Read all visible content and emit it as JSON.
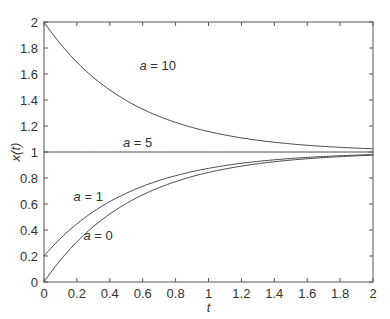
{
  "chart_data": {
    "type": "line",
    "title": "",
    "xlabel": "t",
    "ylabel": "x(t)",
    "xlim": [
      0,
      2
    ],
    "ylim": [
      0,
      2
    ],
    "grid": false,
    "legend": "none (inline annotations)",
    "x_ticks": [
      "0",
      "0.2",
      "0.4",
      "0.6",
      "0.8",
      "1",
      "1.2",
      "1.4",
      "1.6",
      "1.8",
      "2"
    ],
    "y_ticks": [
      "0",
      "0.2",
      "0.4",
      "0.6",
      "0.8",
      "1",
      "1.2",
      "1.4",
      "1.6",
      "1.8",
      "2"
    ],
    "x": [
      0,
      0.2,
      0.4,
      0.6,
      0.8,
      1.0,
      1.2,
      1.4,
      1.6,
      1.8,
      2.0
    ],
    "series": [
      {
        "name": "a = 10",
        "values": [
          2.0,
          1.67,
          1.45,
          1.3,
          1.2,
          1.14,
          1.09,
          1.06,
          1.04,
          1.03,
          1.02
        ]
      },
      {
        "name": "a = 5",
        "values": [
          1.0,
          1.0,
          1.0,
          1.0,
          1.0,
          1.0,
          1.0,
          1.0,
          1.0,
          1.0,
          1.0
        ]
      },
      {
        "name": "a = 1",
        "values": [
          0.2,
          0.46,
          0.64,
          0.76,
          0.84,
          0.89,
          0.93,
          0.95,
          0.97,
          0.98,
          0.99
        ]
      },
      {
        "name": "a = 0",
        "values": [
          0.0,
          0.33,
          0.55,
          0.7,
          0.8,
          0.86,
          0.91,
          0.94,
          0.96,
          0.97,
          0.98
        ]
      }
    ],
    "annotations": [
      {
        "text": "a = 10",
        "x": 0.58,
        "y": 1.63
      },
      {
        "text": "a = 5",
        "x": 0.48,
        "y": 1.04
      },
      {
        "text": "a = 1",
        "x": 0.18,
        "y": 0.62
      },
      {
        "text": "a = 0",
        "x": 0.24,
        "y": 0.32
      }
    ]
  }
}
